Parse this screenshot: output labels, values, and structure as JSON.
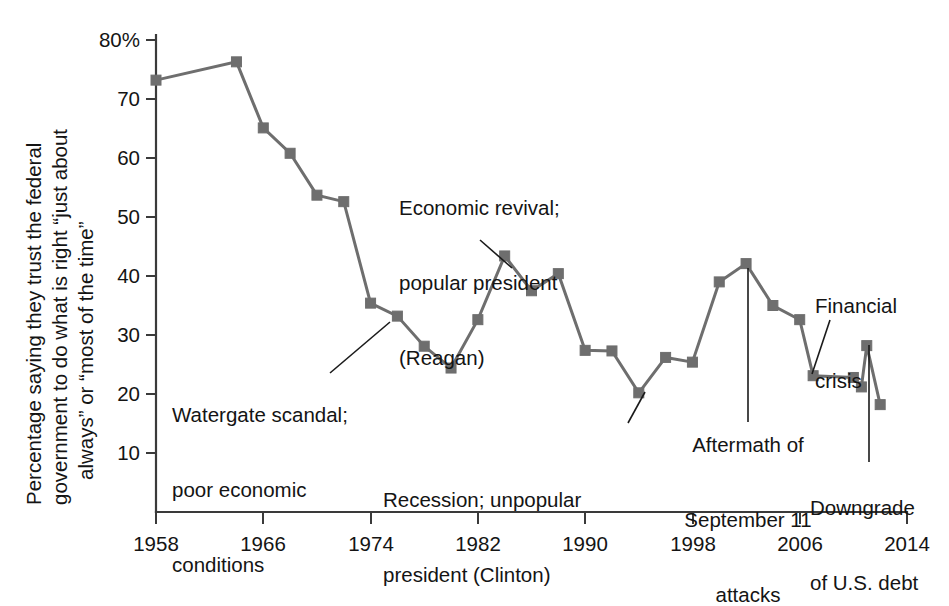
{
  "chart_data": {
    "type": "line",
    "title": "",
    "xlabel": "",
    "ylabel": "Percentage saying they trust the federal government to do what is right “just about always” or “most of the time”",
    "ylabel_lines": [
      "Percentage saying they trust the federal",
      "government to do what is right “just about",
      "always” or “most of the time”"
    ],
    "xlim": [
      1958,
      2014
    ],
    "ylim": [
      0,
      80
    ],
    "grid": false,
    "legend": "none",
    "y_ticks": [
      10,
      20,
      30,
      40,
      50,
      60,
      70,
      80
    ],
    "y_tick_labels": [
      "10",
      "20",
      "30",
      "40",
      "50",
      "60",
      "70",
      "80%"
    ],
    "x_ticks": [
      1958,
      1966,
      1974,
      1982,
      1990,
      1998,
      2006,
      2014
    ],
    "x_tick_labels": [
      "1958",
      "1966",
      "1974",
      "1982",
      "1990",
      "1998",
      "2006",
      "2014"
    ],
    "series": [
      {
        "name": "Trust in federal government",
        "color": "#6e6e6e",
        "x": [
          1958,
          1964,
          1966,
          1968,
          1970,
          1972,
          1974,
          1976,
          1978,
          1980,
          1982,
          1984,
          1986,
          1988,
          1990,
          1992,
          1994,
          1996,
          1998,
          2000,
          2002,
          2004,
          2006,
          2007,
          2010,
          2010.6,
          2011,
          2012
        ],
        "values": [
          73.2,
          76.3,
          65.1,
          60.8,
          53.7,
          52.6,
          35.4,
          33.2,
          28.1,
          24.4,
          32.6,
          43.4,
          37.5,
          40.4,
          27.4,
          27.3,
          20.2,
          26.2,
          25.4,
          39.0,
          42.1,
          35.0,
          32.6,
          23.1,
          22.8,
          21.2,
          28.2,
          18.2
        ]
      }
    ],
    "annotations": [
      {
        "id": "watergate",
        "lines": [
          "Watergate scandal;",
          "poor economic",
          "conditions"
        ],
        "align": "left"
      },
      {
        "id": "reagan",
        "lines": [
          "Economic revival;",
          "popular president",
          "(Reagan)"
        ],
        "align": "left"
      },
      {
        "id": "clinton",
        "lines": [
          "Recession; unpopular",
          "president (Clinton)"
        ],
        "align": "left"
      },
      {
        "id": "sept11",
        "lines": [
          "Aftermath of",
          "September 11",
          "attacks"
        ],
        "align": "center"
      },
      {
        "id": "financial-crisis",
        "lines": [
          "Financial",
          "crisis"
        ],
        "align": "left"
      },
      {
        "id": "downgrade",
        "lines": [
          "Downgrade",
          "of U.S. debt"
        ],
        "align": "left"
      }
    ]
  },
  "axis": {
    "y_tick_80": "80%",
    "y_tick_70": "70",
    "y_tick_60": "60",
    "y_tick_50": "50",
    "y_tick_40": "40",
    "y_tick_30": "30",
    "y_tick_20": "20",
    "y_tick_10": "10",
    "x_tick_1958": "1958",
    "x_tick_1966": "1966",
    "x_tick_1974": "1974",
    "x_tick_1982": "1982",
    "x_tick_1990": "1990",
    "x_tick_1998": "1998",
    "x_tick_2006": "2006",
    "x_tick_2014": "2014"
  },
  "ylabel": {
    "line1": "Percentage saying they trust the federal",
    "line2": "government to do what is right “just about",
    "line3": "always” or “most of the time”"
  },
  "annotations": {
    "watergate": {
      "line1": "Watergate scandal;",
      "line2": "poor economic",
      "line3": "conditions"
    },
    "reagan": {
      "line1": "Economic revival;",
      "line2": "popular president",
      "line3": "(Reagan)"
    },
    "clinton": {
      "line1": "Recession; unpopular",
      "line2": "president (Clinton)"
    },
    "sept11": {
      "line1": "Aftermath of",
      "line2": "September 11",
      "line3": "attacks"
    },
    "financial": {
      "line1": "Financial",
      "line2": "crisis"
    },
    "downgrade": {
      "line1": "Downgrade",
      "line2": "of U.S. debt"
    }
  },
  "colors": {
    "series": "#6e6e6e",
    "axis": "#3a3a3a",
    "text": "#141414",
    "background": "#ffffff"
  }
}
